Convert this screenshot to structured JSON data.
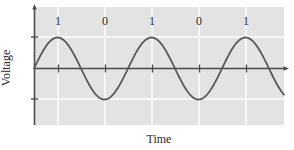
{
  "figure": {
    "background": "#ffffff",
    "panel_color": "#e3e3e3",
    "grid_color": "#f7f7f7",
    "axis_color": "#4a4a4a",
    "curve_color": "#595959",
    "text_color": "#2b2b2b"
  },
  "axes": {
    "x_title": "Time",
    "y_title": "Voltage"
  },
  "bit_labels": [
    {
      "text": "1",
      "x": 58,
      "y": 21
    },
    {
      "text": "0",
      "x": 105,
      "y": 21
    },
    {
      "text": "1",
      "x": 152,
      "y": 21
    },
    {
      "text": "0",
      "x": 199,
      "y": 21
    },
    {
      "text": "1",
      "x": 246,
      "y": 21
    }
  ],
  "gridlines": {
    "vertical_x": [
      58,
      105,
      152,
      199,
      246
    ],
    "horizontal_y": [
      37,
      99
    ]
  },
  "ticks": {
    "x_positions": [
      58,
      105,
      152,
      199,
      246
    ]
  },
  "chart_data": {
    "type": "line",
    "title": "",
    "xlabel": "Time",
    "ylabel": "Voltage",
    "xlim": [
      0,
      5.32
    ],
    "ylim": [
      -1.3,
      1.65
    ],
    "grid": true,
    "legend": null,
    "annotations": [
      {
        "text": "1",
        "x": 0.5,
        "y": 1.5
      },
      {
        "text": "0",
        "x": 1.5,
        "y": 1.5
      },
      {
        "text": "1",
        "x": 2.5,
        "y": 1.5
      },
      {
        "text": "0",
        "x": 3.5,
        "y": 1.5
      },
      {
        "text": "1",
        "x": 4.5,
        "y": 1.5
      }
    ],
    "series": [
      {
        "name": "Voltage signal",
        "description": "Sine wave, amplitude 1, period 2 time units",
        "amplitude": 1,
        "period": 2,
        "phase": 0,
        "x": [
          0,
          0.25,
          0.5,
          0.75,
          1,
          1.25,
          1.5,
          1.75,
          2,
          2.25,
          2.5,
          2.75,
          3,
          3.25,
          3.5,
          3.75,
          4,
          4.25,
          4.5,
          4.75,
          5,
          5.32
        ],
        "values": [
          0,
          0.707,
          1,
          0.707,
          0,
          -0.707,
          -1,
          -0.707,
          0,
          0.707,
          1,
          0.707,
          0,
          -0.707,
          -1,
          -0.707,
          0,
          0.707,
          1,
          0.707,
          0,
          0.896
        ]
      }
    ],
    "bits": [
      "1",
      "0",
      "1",
      "0",
      "1"
    ]
  }
}
